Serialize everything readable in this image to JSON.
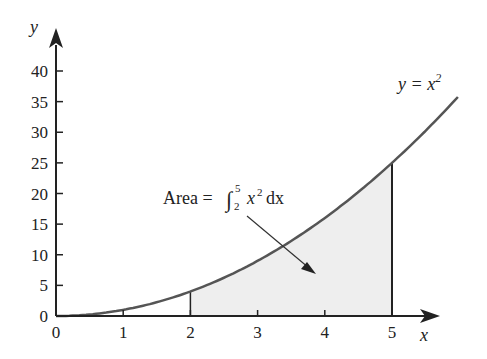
{
  "chart_data": {
    "type": "area",
    "title": "",
    "xlabel": "x",
    "ylabel": "y",
    "x_ticks": [
      "0",
      "1",
      "2",
      "3",
      "4",
      "5"
    ],
    "y_ticks": [
      "0",
      "5",
      "10",
      "15",
      "20",
      "25",
      "30",
      "35",
      "40"
    ],
    "xlim": [
      0,
      6
    ],
    "ylim": [
      0,
      43
    ],
    "grid": false,
    "series": [
      {
        "name": "y = x^2",
        "function": "x^2",
        "x": [
          0,
          1,
          2,
          3,
          4,
          5,
          6
        ],
        "values": [
          0,
          1,
          4,
          9,
          16,
          25,
          36
        ]
      }
    ],
    "shaded_region": {
      "from": 2,
      "to": 5,
      "value": 39
    },
    "annotations": [
      {
        "text": "y = x2",
        "label_parts": {
          "lhs": "y = x",
          "sup": "2"
        },
        "position": "upper right near curve"
      },
      {
        "text": "Area = ∫_2^5 x^2 dx",
        "position": "middle, arrow pointing into shaded region"
      }
    ],
    "colors": {
      "curve": "#555555",
      "fill": "#eeeeee",
      "axis": "#222222"
    }
  },
  "labels": {
    "y_axis": "y",
    "x_axis": "x",
    "curve_lhs": "y = x",
    "curve_sup": "2",
    "area_prefix": "Area =",
    "integral_sign": "∫",
    "integral_upper": "5",
    "integral_lower": "2",
    "integrand": "x",
    "integrand_sup": "2",
    "differential": "dx"
  },
  "ticks": {
    "x": [
      "0",
      "1",
      "2",
      "3",
      "4",
      "5"
    ],
    "y": [
      "0",
      "5",
      "10",
      "15",
      "20",
      "25",
      "30",
      "35",
      "40"
    ]
  }
}
